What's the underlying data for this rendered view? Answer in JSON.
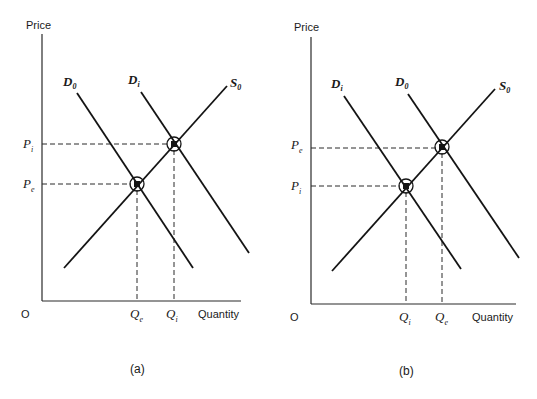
{
  "figure": {
    "panels": [
      {
        "id": "a",
        "caption": "(a)",
        "y_axis_label": "Price",
        "x_axis_label": "Quantity",
        "origin_label": "O",
        "curves": [
          {
            "name": "D",
            "sub": "0",
            "type": "demand"
          },
          {
            "name": "D",
            "sub": "i",
            "type": "demand"
          },
          {
            "name": "S",
            "sub": "0",
            "type": "supply"
          }
        ],
        "price_ticks": [
          {
            "name": "P",
            "sub": "i",
            "position": "upper"
          },
          {
            "name": "P",
            "sub": "e",
            "position": "lower"
          }
        ],
        "quantity_ticks": [
          {
            "name": "Q",
            "sub": "e",
            "position": "left"
          },
          {
            "name": "Q",
            "sub": "i",
            "position": "right"
          }
        ],
        "equilibria": [
          {
            "label": "(Q_e, P_e)",
            "curves": [
              "D0",
              "S0"
            ]
          },
          {
            "label": "(Q_i, P_i)",
            "curves": [
              "Di",
              "S0"
            ]
          }
        ]
      },
      {
        "id": "b",
        "caption": "(b)",
        "y_axis_label": "Price",
        "x_axis_label": "Quantity",
        "origin_label": "O",
        "curves": [
          {
            "name": "D",
            "sub": "i",
            "type": "demand"
          },
          {
            "name": "D",
            "sub": "0",
            "type": "demand"
          },
          {
            "name": "S",
            "sub": "0",
            "type": "supply"
          }
        ],
        "price_ticks": [
          {
            "name": "P",
            "sub": "e",
            "position": "upper"
          },
          {
            "name": "P",
            "sub": "i",
            "position": "lower"
          }
        ],
        "quantity_ticks": [
          {
            "name": "Q",
            "sub": "i",
            "position": "left"
          },
          {
            "name": "Q",
            "sub": "e",
            "position": "right"
          }
        ],
        "equilibria": [
          {
            "label": "(Q_i, P_i)",
            "curves": [
              "Di",
              "S0"
            ]
          },
          {
            "label": "(Q_e, P_e)",
            "curves": [
              "D0",
              "S0"
            ]
          }
        ]
      }
    ]
  }
}
